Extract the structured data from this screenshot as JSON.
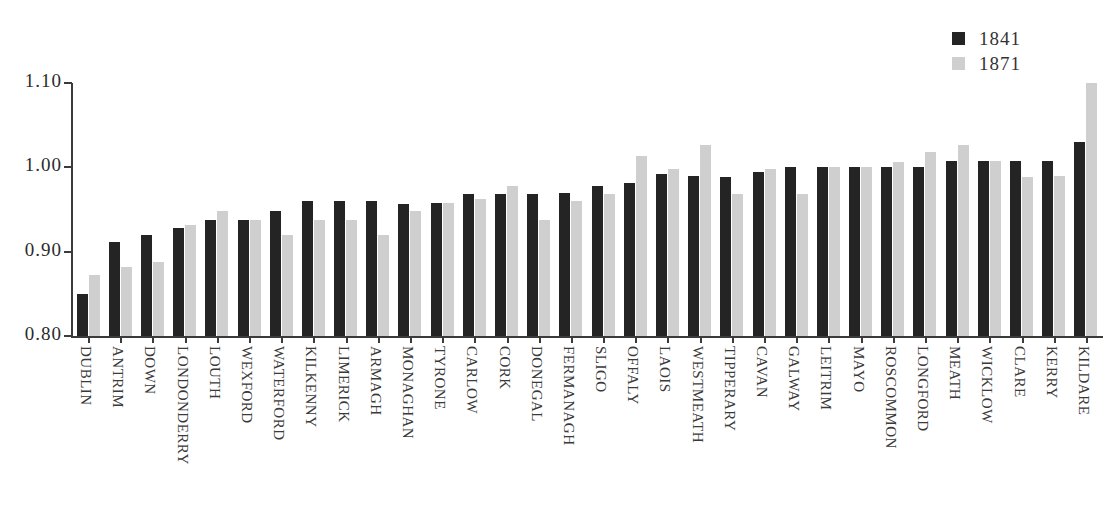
{
  "legend": {
    "entries": [
      {
        "label": "1841",
        "color": "#242424",
        "name": "series-1841"
      },
      {
        "label": "1871",
        "color": "#cfcfcf",
        "name": "series-1871"
      }
    ]
  },
  "axis": {
    "y_ticks": [
      "1.10",
      "1.00",
      "0.90",
      "0.80"
    ]
  },
  "chart_data": {
    "type": "bar",
    "title": "",
    "xlabel": "",
    "ylabel": "",
    "ylim": [
      0.8,
      1.1
    ],
    "grid": false,
    "legend_position": "top-right",
    "categories": [
      "DUBLIN",
      "ANTRIM",
      "DOWN",
      "LONDONDERRY",
      "LOUTH",
      "WEXFORD",
      "WATERFORD",
      "KILKENNY",
      "LIMERICK",
      "ARMAGH",
      "MONAGHAN",
      "TYRONE",
      "CARLOW",
      "CORK",
      "DONEGAL",
      "FERMANAGH",
      "SLIGO",
      "OFFALY",
      "LAOIS",
      "WESTMEATH",
      "TIPPERARY",
      "CAVAN",
      "GALWAY",
      "LEITRIM",
      "MAYO",
      "ROSCOMMON",
      "LONGFORD",
      "MEATH",
      "WICKLOW",
      "CLARE",
      "KERRY",
      "KILDARE"
    ],
    "series": [
      {
        "name": "1841",
        "color": "#242424",
        "values": [
          0.85,
          0.912,
          0.92,
          0.928,
          0.938,
          0.938,
          0.948,
          0.96,
          0.96,
          0.96,
          0.956,
          0.958,
          0.968,
          0.968,
          0.968,
          0.97,
          0.978,
          0.982,
          0.992,
          0.99,
          0.988,
          0.994,
          1.0,
          1.0,
          1.0,
          1.0,
          1.0,
          1.008,
          1.008,
          1.008,
          1.008,
          1.03
        ]
      },
      {
        "name": "1871",
        "color": "#cfcfcf",
        "values": [
          0.872,
          0.882,
          0.888,
          0.932,
          0.948,
          0.938,
          0.92,
          0.938,
          0.938,
          0.92,
          0.948,
          0.958,
          0.962,
          0.978,
          0.938,
          0.96,
          0.968,
          1.014,
          0.998,
          1.026,
          0.968,
          0.998,
          0.968,
          1.0,
          1.0,
          1.006,
          1.018,
          1.026,
          1.008,
          0.988,
          0.99,
          1.1
        ]
      }
    ]
  }
}
